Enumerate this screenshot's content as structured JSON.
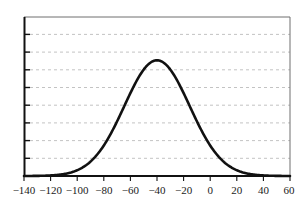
{
  "chart_data": {
    "type": "line",
    "title": "",
    "subtitle": "",
    "xlabel": "",
    "ylabel": "",
    "xlim": [
      -140,
      60
    ],
    "ylim": [
      0,
      5.25
    ],
    "xticks": [
      -140,
      -120,
      -100,
      -80,
      -60,
      -40,
      -20,
      0,
      20,
      40,
      60
    ],
    "xticklabels": [
      "−140",
      "−120",
      "−100",
      "−80",
      "−60",
      "−40",
      "−20",
      "0",
      "20",
      "40",
      "60"
    ],
    "yticks": [
      0,
      0.6,
      1.2,
      1.8,
      2.4,
      3.0,
      3.6,
      4.2,
      4.8
    ],
    "yticklabels": [
      "",
      "",
      "",
      "",
      "",
      "",
      "",
      "",
      ""
    ],
    "grid": {
      "horizontal": true,
      "vertical": false,
      "style": "dashed",
      "color": "#b4b4b4"
    },
    "legend": {
      "visible": false,
      "position": "none"
    },
    "series": [
      {
        "name": "gaussian-curve",
        "color": "#111111",
        "linewidth": 2.6,
        "peak_x": -40,
        "peak_y": 3.82,
        "sigma": 24.5,
        "x": [
          -140,
          -135,
          -130,
          -125,
          -120,
          -115,
          -110,
          -105,
          -100,
          -95,
          -90,
          -85,
          -80,
          -75,
          -70,
          -65,
          -60,
          -55,
          -50,
          -45,
          -40,
          -35,
          -30,
          -25,
          -20,
          -15,
          -10,
          -5,
          0,
          5,
          10,
          15,
          20,
          25,
          30,
          35,
          40,
          45,
          50,
          55,
          60
        ],
        "y": [
          0.011,
          0.021,
          0.037,
          0.064,
          0.107,
          0.173,
          0.27,
          0.408,
          0.597,
          0.846,
          1.162,
          1.545,
          1.987,
          2.473,
          2.978,
          3.368,
          3.631,
          3.782,
          3.829,
          3.8,
          3.82,
          3.8,
          3.829,
          3.782,
          3.631,
          3.368,
          2.978,
          2.473,
          1.987,
          1.545,
          1.162,
          0.846,
          0.597,
          0.408,
          0.27,
          0.173,
          0.107,
          0.064,
          0.037,
          0.021,
          0.011
        ]
      }
    ],
    "axes": {
      "frame": true,
      "frame_color": "#6e6e6e",
      "axis_color": "#111111",
      "tick_direction": "in"
    }
  }
}
